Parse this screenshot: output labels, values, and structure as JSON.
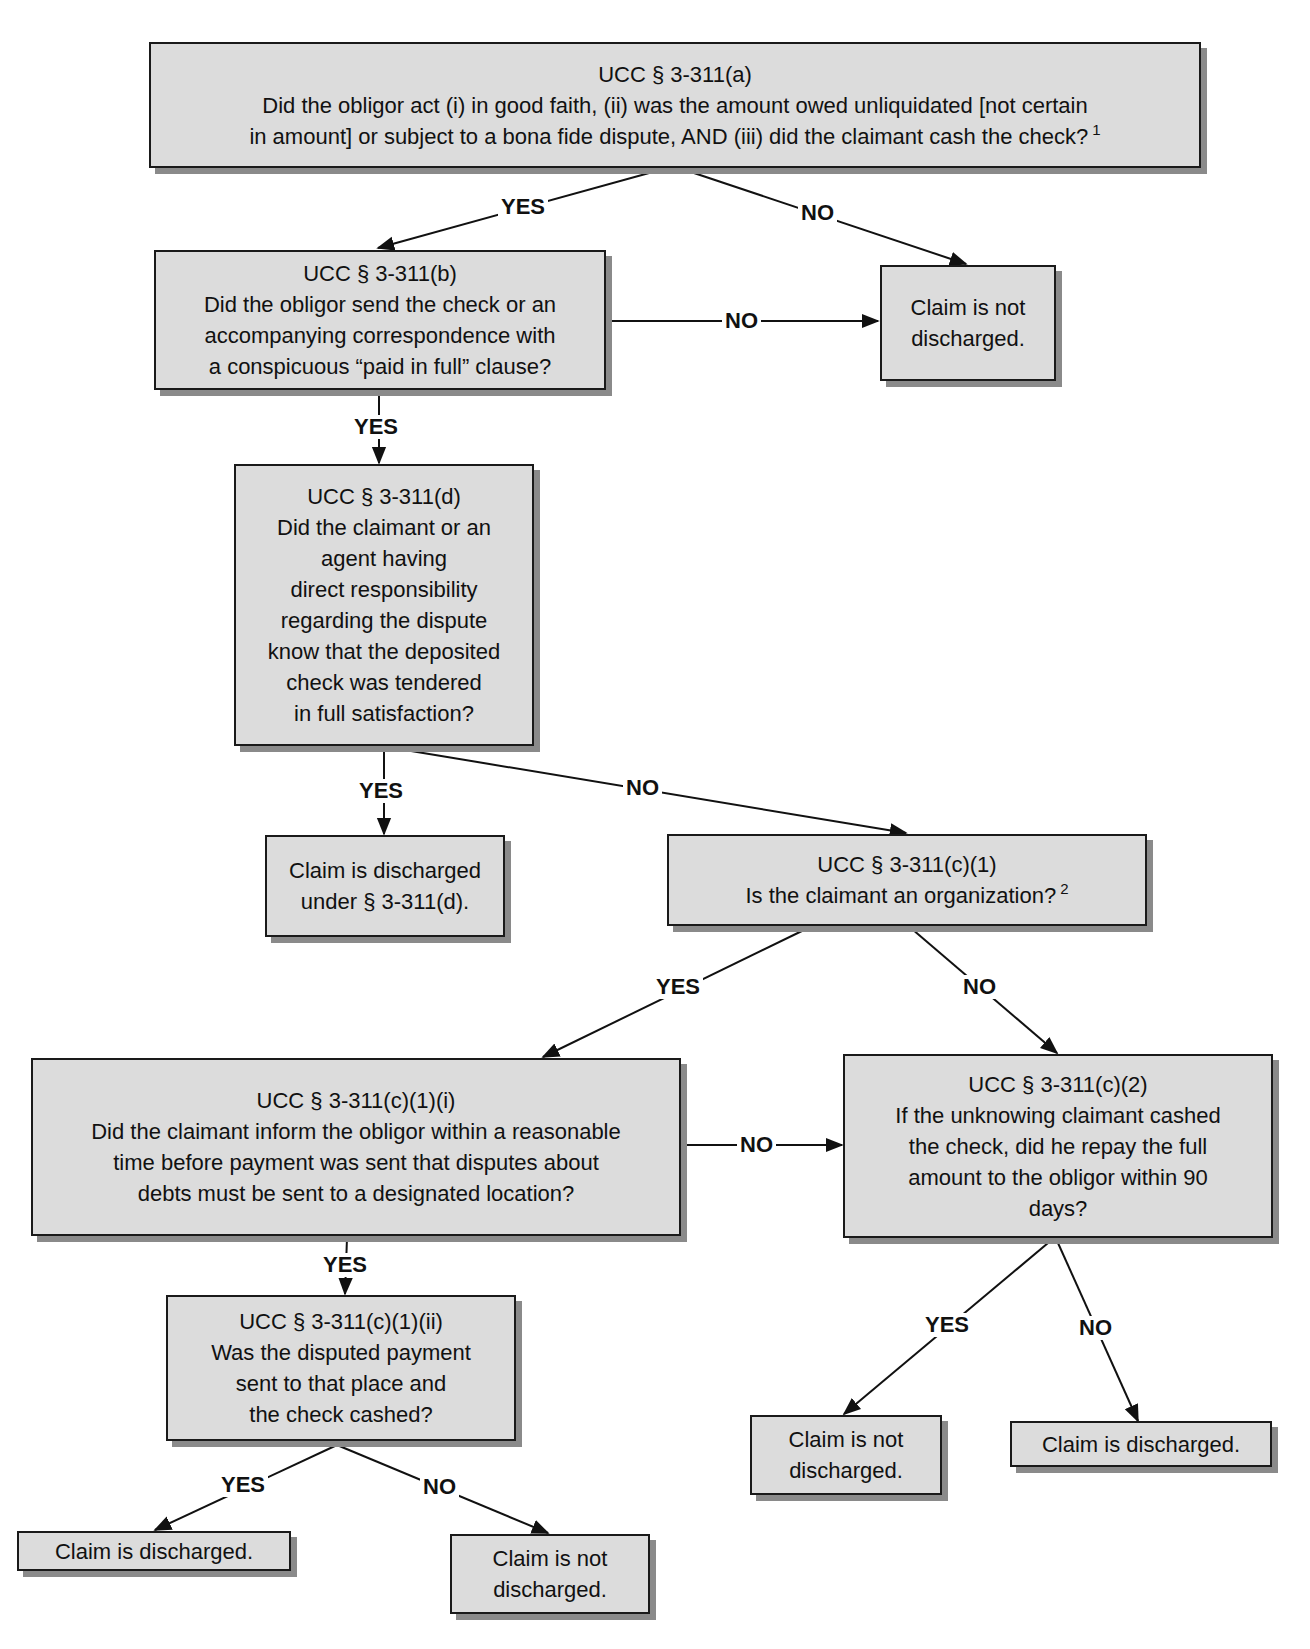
{
  "diagram": {
    "type": "flowchart",
    "colors": {
      "node_fill": "#dcdcdc",
      "node_border": "#1a1a1a",
      "node_shadow": "#8a8a8a",
      "edge": "#111111",
      "background": "#ffffff"
    },
    "nodes": {
      "a": {
        "title": "UCC § 3-311(a)",
        "lines": [
          "Did the obligor act (i) in good faith, (ii) was the amount owed unliquidated [not certain",
          "in amount] or subject to a bona fide dispute, AND (iii) did the claimant cash the check?"
        ],
        "footnote": "1"
      },
      "b": {
        "title": "UCC § 3-311(b)",
        "lines": [
          "Did the obligor send the check or an",
          "accompanying correspondence with",
          "a conspicuous “paid in full” clause?"
        ]
      },
      "not_discharged_1": {
        "lines": [
          "Claim is not",
          "discharged."
        ]
      },
      "d": {
        "title": "UCC § 3-311(d)",
        "lines": [
          "Did the claimant or an",
          "agent having",
          "direct responsibility",
          "regarding the dispute",
          "know that the deposited",
          "check was tendered",
          "in full satisfaction?"
        ]
      },
      "discharged_d": {
        "lines": [
          "Claim is discharged",
          "under § 3-311(d)."
        ]
      },
      "c1": {
        "title": "UCC § 3-311(c)(1)",
        "lines": [
          "Is the claimant an organization?"
        ],
        "footnote": "2"
      },
      "c1i": {
        "title": "UCC § 3-311(c)(1)(i)",
        "lines": [
          "Did the claimant inform the obligor within a reasonable",
          "time before payment was sent that disputes about",
          "debts must be sent to a designated location?"
        ]
      },
      "c2": {
        "title": "UCC § 3-311(c)(2)",
        "lines": [
          "If the unknowing claimant cashed",
          "the check, did he repay the full",
          "amount  to the obligor within 90",
          "days?"
        ]
      },
      "c1ii": {
        "title": "UCC § 3-311(c)(1)(ii)",
        "lines": [
          "Was the disputed payment",
          "sent to that place and",
          "the check cashed?"
        ]
      },
      "not_discharged_2": {
        "lines": [
          "Claim is not",
          "discharged."
        ]
      },
      "discharged_2": {
        "lines": [
          "Claim is discharged."
        ]
      },
      "discharged_3": {
        "lines": [
          "Claim is discharged."
        ]
      },
      "not_discharged_3": {
        "lines": [
          "Claim is not",
          "discharged."
        ]
      }
    },
    "edges": [
      {
        "from": "a",
        "to": "b",
        "label": "YES"
      },
      {
        "from": "a",
        "to": "not_discharged_1",
        "label": "NO"
      },
      {
        "from": "b",
        "to": "not_discharged_1",
        "label": "NO"
      },
      {
        "from": "b",
        "to": "d",
        "label": "YES"
      },
      {
        "from": "d",
        "to": "discharged_d",
        "label": "YES"
      },
      {
        "from": "d",
        "to": "c1",
        "label": "NO"
      },
      {
        "from": "c1",
        "to": "c1i",
        "label": "YES"
      },
      {
        "from": "c1",
        "to": "c2",
        "label": "NO"
      },
      {
        "from": "c1i",
        "to": "c2",
        "label": "NO"
      },
      {
        "from": "c1i",
        "to": "c1ii",
        "label": "YES"
      },
      {
        "from": "c2",
        "to": "not_discharged_2",
        "label": "YES"
      },
      {
        "from": "c2",
        "to": "discharged_2",
        "label": "NO"
      },
      {
        "from": "c1ii",
        "to": "discharged_3",
        "label": "YES"
      },
      {
        "from": "c1ii",
        "to": "not_discharged_3",
        "label": "NO"
      }
    ]
  }
}
